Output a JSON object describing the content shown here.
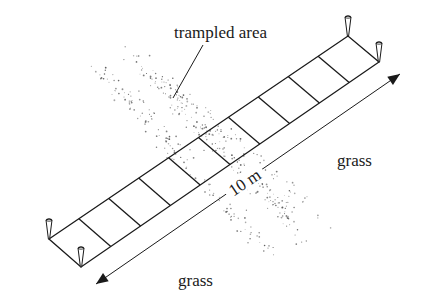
{
  "labels": {
    "trampled_area": "trampled area",
    "grass_right": "grass",
    "grass_bottom": "grass",
    "length": "10 m"
  },
  "strip": {
    "cells": 10,
    "corners": {
      "left": [
        49,
        239
      ],
      "top": [
        348,
        36
      ],
      "right": [
        379,
        62
      ],
      "bottom": [
        81,
        267
      ]
    }
  },
  "pegs": [
    {
      "name": "peg-top",
      "x": 348,
      "y": 36
    },
    {
      "name": "peg-right",
      "x": 379,
      "y": 62
    },
    {
      "name": "peg-left",
      "x": 49,
      "y": 239
    },
    {
      "name": "peg-bottom",
      "x": 81,
      "y": 267
    }
  ],
  "measurement_arrow": {
    "start": [
      96,
      284
    ],
    "end": [
      400,
      74
    ]
  },
  "colors": {
    "ink": "#1a1a1a",
    "stipple": "#555555",
    "background": "#ffffff"
  }
}
